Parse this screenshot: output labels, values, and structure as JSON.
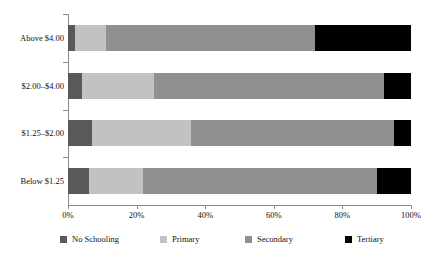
{
  "chart_data": {
    "type": "bar",
    "orientation": "horizontal",
    "stacked": true,
    "normalized": true,
    "title": "",
    "subtitle": "",
    "xlabel": "",
    "ylabel": "",
    "xlim": [
      0,
      100
    ],
    "grid": false,
    "legend_position": "bottom",
    "categories": [
      "Above $4.00",
      "$2.00–$4.00",
      "$1.25–$2.00",
      "Below $1.25"
    ],
    "xtick_labels": [
      "0%",
      "20%",
      "40%",
      "60%",
      "80%",
      "100%"
    ],
    "xtick_values": [
      0,
      20,
      40,
      60,
      80,
      100
    ],
    "series": [
      {
        "name": "No Schooling",
        "color": "#595959",
        "values": [
          2,
          4,
          7,
          6
        ]
      },
      {
        "name": "Primary",
        "color": "#c2c2c2",
        "values": [
          9,
          21,
          29,
          16
        ]
      },
      {
        "name": "Secondary",
        "color": "#909090",
        "values": [
          61,
          67,
          59,
          68
        ]
      },
      {
        "name": "Tertiary",
        "color": "#000000",
        "values": [
          28,
          8,
          5,
          10
        ]
      }
    ],
    "legend": [
      {
        "label": "No Schooling",
        "color": "#595959"
      },
      {
        "label": "Primary",
        "color": "#c2c2c2"
      },
      {
        "label": "Secondary",
        "color": "#909090"
      },
      {
        "label": "Tertiary",
        "color": "#000000"
      }
    ]
  }
}
